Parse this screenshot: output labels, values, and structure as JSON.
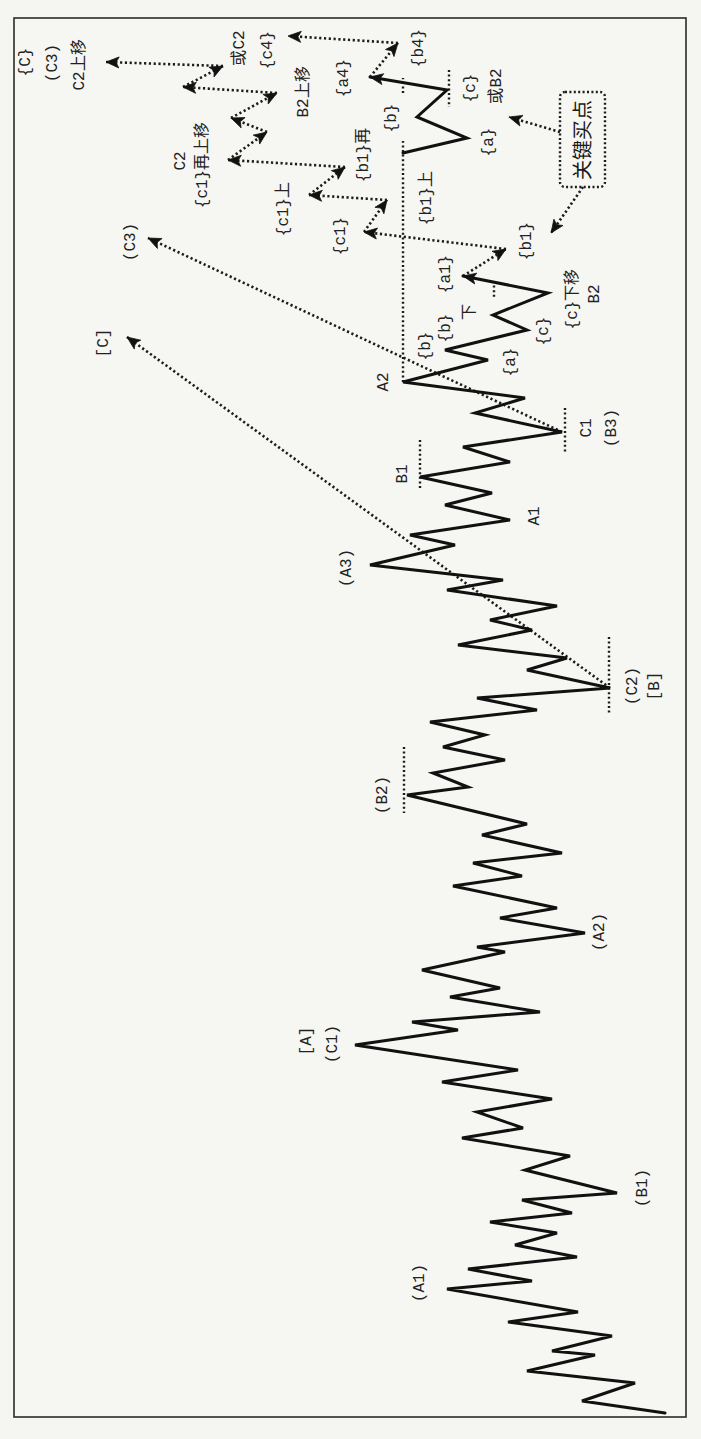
{
  "callout": {
    "text": "关键买点"
  },
  "labels": [
    {
      "text": "{C}"
    },
    {
      "text": "(C3)"
    },
    {
      "text": "C2上移"
    },
    {
      "text": "或C2"
    },
    {
      "text": "{c4}"
    },
    {
      "text": "B2上移"
    },
    {
      "text": "C2"
    },
    {
      "text": "{c1}再上移"
    },
    {
      "text": "{c1}上"
    },
    {
      "text": "{c1}"
    },
    {
      "text": "{b1}再"
    },
    {
      "text": "{a4}"
    },
    {
      "text": "{b4}"
    },
    {
      "text": "{b}"
    },
    {
      "text": "{b1}上"
    },
    {
      "text": "{c}"
    },
    {
      "text": "或B2"
    },
    {
      "text": "{a}"
    },
    {
      "text": "{b1}"
    },
    {
      "text": "(C3)"
    },
    {
      "text": "[C]"
    },
    {
      "text": "A2"
    },
    {
      "text": "{b}"
    },
    {
      "text": "{b}"
    },
    {
      "text": "下"
    },
    {
      "text": "{a1}"
    },
    {
      "text": "{a}"
    },
    {
      "text": "{c}"
    },
    {
      "text": "{c}下移"
    },
    {
      "text": "B2"
    },
    {
      "text": "C1"
    },
    {
      "text": "(B3)"
    },
    {
      "text": "B1"
    },
    {
      "text": "A1"
    },
    {
      "text": "(A3)"
    },
    {
      "text": "(C2)"
    },
    {
      "text": "[B]"
    },
    {
      "text": "(B2)"
    },
    {
      "text": "(A2)"
    },
    {
      "text": "[A]"
    },
    {
      "text": "(C1)"
    },
    {
      "text": "(B1)"
    },
    {
      "text": "(A1)"
    }
  ],
  "diagram": {
    "main_wave": "665,1413 582,1401 635,1383 527,1371 595,1355 552,1351 612,1336 508,1322 578,1312 447,1289 532,1281 468,1269 577,1257 515,1245 557,1233 490,1222 572,1213 522,1200 617,1193 525,1170 570,1156 462,1138 523,1128 477,1112 552,1099 442,1082 518,1070 355,1045 458,1030 412,1022 540,1012 450,997 500,988 422,970 505,952 477,947 585,933 500,918 557,908 453,886 522,876 473,863 562,853 482,835 527,824 407,795 468,787 433,773 505,760 443,747 485,735 430,722 537,710 477,698 610,688 527,670 567,658 458,645 532,630 490,620 557,606 447,590 503,580 370,565 455,545 410,535 510,520 445,505 492,493 420,477 510,462 463,447 562,432 475,413 525,398 403,382 488,360 445,350 527,330 493,315 548,293 463,276",
    "alternate_wave": "403,153 467,138 417,117 447,90 370,77",
    "level_lines": [
      "403,382 403,141",
      "403,93 403,78",
      "565,408 565,452",
      "420,440 420,488",
      "609,637 609,713",
      "404,747 404,813",
      "449,70 449,107",
      "494,281 494,297"
    ],
    "projection_arrows": [
      "463,276 506,249",
      "506,249 364,232",
      "364,232 387,200",
      "387,200 309,195",
      "309,195 345,167",
      "345,167 228,160",
      "228,160 267,132",
      "267,132 231,118",
      "231,118 277,93",
      "277,93 183,87",
      "183,87 223,66",
      "223,66 106,62",
      "370,77 398,43",
      "398,43 288,36"
    ],
    "trend_arrows": [
      "562,432 148,238",
      "610,688 127,337"
    ],
    "callout_arrows": [
      "560,132 509,117",
      "583,187 551,233"
    ]
  }
}
